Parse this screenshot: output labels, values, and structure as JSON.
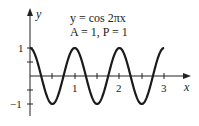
{
  "chart_data": {
    "type": "line",
    "title": "y = cos 2πx",
    "annotation": "A = 1, P = 1",
    "xlabel": "x",
    "ylabel": "y",
    "xlim": [
      0,
      3
    ],
    "ylim": [
      -1,
      1
    ],
    "x_ticks": [
      0.5,
      1,
      1.5,
      2,
      2.5,
      3
    ],
    "x_tick_labels": [
      "1",
      "2",
      "3"
    ],
    "y_ticks": [
      -1,
      -0.5,
      0.5,
      1
    ],
    "y_tick_labels": [
      "1",
      "−1"
    ],
    "grid": false,
    "series": [
      {
        "name": "y = cos 2πx",
        "x": [
          0,
          0.25,
          0.5,
          0.75,
          1,
          1.25,
          1.5,
          1.75,
          2,
          2.25,
          2.5,
          2.75,
          3
        ],
        "values": [
          1,
          0,
          -1,
          0,
          1,
          0,
          -1,
          0,
          1,
          0,
          -1,
          0,
          1
        ]
      }
    ]
  },
  "labels": {
    "equation": "y = cos 2πx",
    "params": "A = 1, P = 1",
    "y_axis": "y",
    "x_axis": "x",
    "tick_x1": "1",
    "tick_x2": "2",
    "tick_x3": "3",
    "tick_y1": "1",
    "tick_ym1": "−1"
  }
}
